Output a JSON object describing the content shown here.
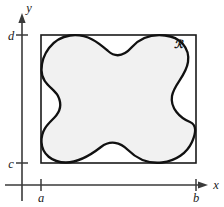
{
  "figure": {
    "background_color": "#ffffff"
  },
  "axes": {
    "x_axis": {
      "label": "x",
      "icon": "arrow-right-icon",
      "color": "#3a3a3a"
    },
    "y_axis": {
      "label": "y",
      "icon": "arrow-up-icon",
      "color": "#3a3a3a"
    }
  },
  "ticks": {
    "x": [
      {
        "label": "a",
        "position_px": 41
      },
      {
        "label": "b",
        "position_px": 196
      }
    ],
    "y": [
      {
        "label": "d",
        "position_px": 35
      },
      {
        "label": "c",
        "position_px": 163
      }
    ]
  },
  "rectangle": {
    "name": "bounding-rectangle",
    "left_px": 41,
    "right_px": 196,
    "top_px": 35,
    "bottom_px": 163,
    "stroke_color": "#1a1a1a",
    "fill": "none"
  },
  "region": {
    "label": "ℛ",
    "fill_color": "#f1f1f1",
    "stroke_color": "#111111",
    "label_x_px": 178,
    "label_y_px": 48,
    "path": "M 41.5 70 C 41.5 55 52 38 70 35.5 C 88 33 100 44 108 51 C 116 58 124 56 132 47 C 141 37 152 34 165 35.5 C 180 37 190 48 188 62 C 186 76 174 84 172 96 C 170 108 180 118 190 122 C 197 125 196 133 192 142 C 187 153 176 161 162 162.5 C 148 164 136 158 128 150 C 120 142 110 140 101 147 C 92 154 80 162.5 66 162.5 C 52 162.5 42 154 41.5 142 C 41 130 48 124 54 118 C 60 112 62 104 58 96 C 54 88 41.5 84 41.5 70 Z"
  },
  "chart_data": {
    "type": "diagram",
    "xlabel": "x",
    "ylabel": "y",
    "x_ticks": [
      "a",
      "b"
    ],
    "y_ticks": [
      "c",
      "d"
    ],
    "annotations": [
      "ℛ"
    ],
    "grid": false,
    "legend": "none"
  }
}
